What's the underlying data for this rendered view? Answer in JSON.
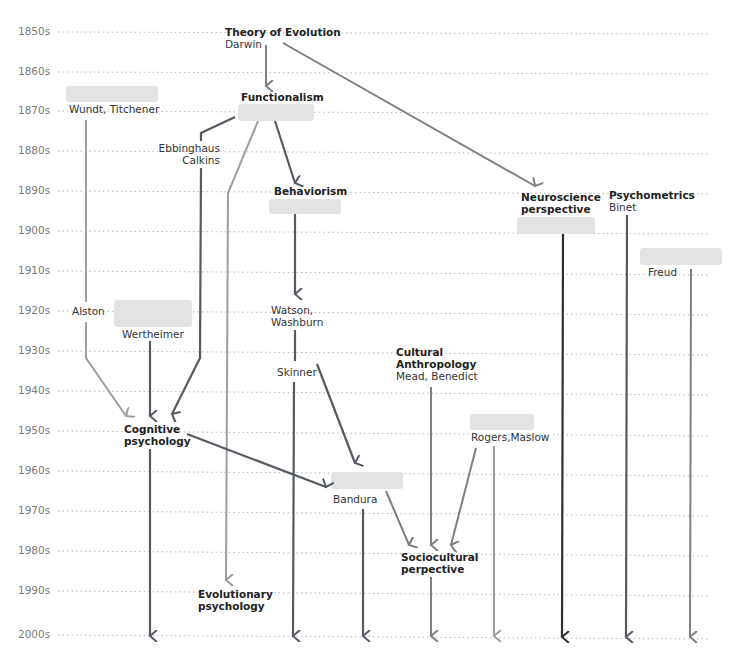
{
  "timeline": {
    "decades": [
      "1850s",
      "1860s",
      "1870s",
      "1880s",
      "1890s",
      "1900s",
      "1910s",
      "1920s",
      "1930s",
      "1940s",
      "1950s",
      "1960s",
      "1970s",
      "1980s",
      "1990s",
      "2000s"
    ]
  },
  "nodes": {
    "evolution": {
      "title": "Theory of Evolution",
      "people": "Darwin"
    },
    "wundt": {
      "people": "Wundt, Titchener"
    },
    "functionalism": {
      "title": "Functionalism"
    },
    "ebbinghaus": {
      "line1": "Ebbinghaus",
      "line2": "Calkins"
    },
    "behaviorism": {
      "title": "Behaviorism"
    },
    "neuroscience": {
      "title_line1": "Neuroscience",
      "title_line2": "perspective"
    },
    "psychometrics": {
      "title": "Psychometrics",
      "people": "Binet"
    },
    "freud": {
      "people": "Freud"
    },
    "alston": {
      "people": "Alston"
    },
    "wertheimer": {
      "people": "Wertheimer"
    },
    "watson": {
      "line1": "Watson,",
      "line2": "Washburn"
    },
    "skinner": {
      "people": "Skinner"
    },
    "anthropology": {
      "title_line1": "Cultural",
      "title_line2": "Anthropology",
      "people": "Mead, Benedict"
    },
    "cognitive": {
      "title_line1": "Cognitive",
      "title_line2": "psychology"
    },
    "humanistic": {
      "people": "Rogers,Maslow"
    },
    "bandura": {
      "people": "Bandura"
    },
    "sociocultural": {
      "title_line1": "Sociocultural",
      "title_line2": "perpective"
    },
    "evolutionary": {
      "title_line1": "Evolutionary",
      "title_line2": "psychology"
    }
  },
  "colors": {
    "dark": "#555a63",
    "medium": "#7b7f86",
    "light": "#9c9ea2",
    "darkest": "#2c2f35",
    "box_fill": "#e3e3e3",
    "gridline": "#b9b9b9"
  }
}
